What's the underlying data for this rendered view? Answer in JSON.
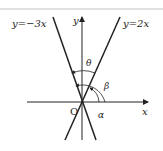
{
  "diagram": {
    "lines": [
      {
        "label": "y=−3x",
        "slope": -3
      },
      {
        "label": "y=2x",
        "slope": 2
      }
    ],
    "axes": {
      "x_label": "x",
      "y_label": "y",
      "origin_label": "O"
    },
    "angles": [
      {
        "label": "θ",
        "description": "angle between the two lines"
      },
      {
        "label": "β",
        "description": "angle of y=-3x from x-axis"
      },
      {
        "label": "α",
        "description": "angle of y=2x from x-axis"
      }
    ],
    "colors": {
      "line": "#222222",
      "background": "#ffffff"
    }
  }
}
